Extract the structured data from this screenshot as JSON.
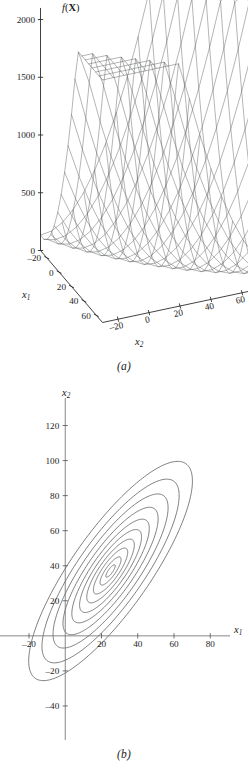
{
  "figure": {
    "panels": [
      {
        "id": "a",
        "caption": "(a)",
        "kind": "surface-mesh"
      },
      {
        "id": "b",
        "caption": "(b)",
        "kind": "contour"
      }
    ]
  },
  "chart_data": [
    {
      "type": "surface",
      "panel": "a",
      "title": "",
      "zlabel": "f(X)",
      "zlabel_parts": {
        "fn": "f",
        "open": "(",
        "var": "X",
        "close": ")"
      },
      "xlabel": "x1",
      "xlabel_parts": {
        "base": "x",
        "sub": "1"
      },
      "ylabel": "x2",
      "ylabel_parts": {
        "base": "x",
        "sub": "2"
      },
      "zticks": [
        0,
        500,
        1000,
        1500,
        2000
      ],
      "ztick_labels": [
        "0",
        "500",
        "1000",
        "1500",
        "2000"
      ],
      "zlim": [
        0,
        2100
      ],
      "xticks": [
        -20,
        0,
        20,
        40,
        60
      ],
      "xtick_labels": [
        "–20",
        "0",
        "20",
        "40",
        "60"
      ],
      "xlim": [
        -30,
        70
      ],
      "yticks": [
        -20,
        0,
        20,
        40,
        60,
        80,
        100
      ],
      "ytick_labels": [
        "–20",
        "0",
        "20",
        "40",
        "60",
        "80",
        "100"
      ],
      "ylim": [
        -30,
        110
      ],
      "grid": false,
      "legend": "none",
      "mesh": {
        "nx": 19,
        "ny": 21,
        "description": "quadratic bowl f(X) rising steeply toward large x2 with a ridge valley",
        "quadratic": {
          "x0": 25,
          "y0": 37,
          "a11": 0.62,
          "a12": -0.48,
          "a22": 0.4
        },
        "peak_values": [
          2100,
          1300
        ],
        "valley_value": 480
      },
      "view": {
        "azimuth": -37.5,
        "elevation": 30
      }
    },
    {
      "type": "contour",
      "panel": "b",
      "title": "",
      "xlabel": "x1",
      "xlabel_parts": {
        "base": "x",
        "sub": "1"
      },
      "ylabel": "x2",
      "ylabel_parts": {
        "base": "x",
        "sub": "2"
      },
      "xticks": [
        -20,
        20,
        40,
        60,
        80
      ],
      "xtick_labels": [
        "–20",
        "20",
        "40",
        "60",
        "80"
      ],
      "xlim": [
        -36,
        92
      ],
      "yticks": [
        -40,
        -20,
        20,
        40,
        60,
        80,
        100,
        120
      ],
      "ytick_labels": [
        "–40",
        "–20",
        "20",
        "40",
        "60",
        "80",
        "100",
        "120"
      ],
      "ylim": [
        -56,
        130
      ],
      "grid": false,
      "legend": "none",
      "center": {
        "x1": 25,
        "x2": 37
      },
      "ellipse": {
        "rotation_deg": 56,
        "semi_major_ratios": [
          4.2,
          9.5,
          15.5,
          21.5,
          28.0,
          35.0,
          43.0,
          52.0,
          62.0,
          74.0
        ],
        "axis_ratio": 0.295,
        "levels": [
          50,
          200,
          450,
          800,
          1250,
          1800,
          2500,
          3300,
          4200,
          5200
        ]
      },
      "contour_count": 10
    }
  ]
}
